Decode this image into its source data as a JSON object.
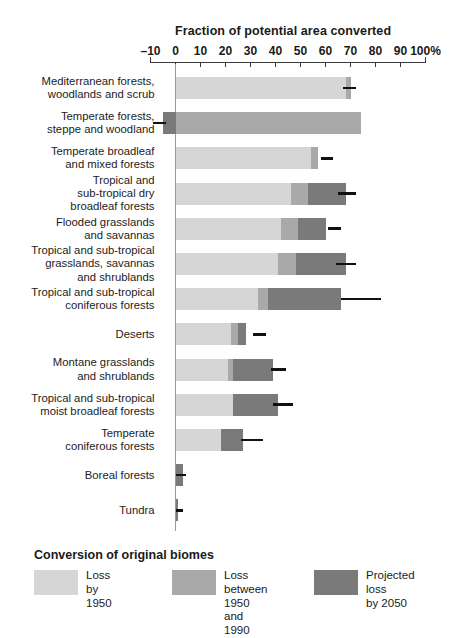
{
  "chart_data": {
    "type": "bar",
    "orientation": "horizontal",
    "stacked": true,
    "title": "Fraction of potential area converted",
    "xlabel": "",
    "ylabel": "",
    "xlim": [
      -10,
      100
    ],
    "xunit": "%",
    "grid": false,
    "legend_position": "bottom",
    "legend_title": "Conversion of original biomes",
    "tick_labels": [
      "–10",
      "0",
      "10",
      "20",
      "30",
      "40",
      "50",
      "60",
      "70",
      "80",
      "90",
      "100%"
    ],
    "tick_values": [
      -10,
      0,
      10,
      20,
      30,
      40,
      50,
      60,
      70,
      80,
      90,
      100
    ],
    "categories": [
      "Mediterranean forests,\nwoodlands and scrub",
      "Temperate forests,\nsteppe and woodland",
      "Temperate broadleaf\nand mixed forests",
      "Tropical and\nsub-tropical dry\nbroadleaf forests",
      "Flooded grasslands\nand savannas",
      "Tropical and sub-tropical\ngrasslands, savannas\nand shrublands",
      "Tropical and sub-tropical\nconiferous forests",
      "Deserts",
      "Montane grasslands\nand shrublands",
      "Tropical and sub-tropical\nmoist broadleaf forests",
      "Temperate\nconiferous forests",
      "Boreal forests",
      "Tundra"
    ],
    "series": [
      {
        "name": "Loss by 1950",
        "color": "#d6d6d6",
        "values": [
          68,
          0,
          54,
          46,
          42,
          41,
          33,
          22,
          21,
          23,
          18,
          0,
          0
        ]
      },
      {
        "name": "Loss between 1950 and 1990",
        "color": "#a9a9a9",
        "values": [
          2,
          74,
          3,
          7,
          7,
          7,
          4,
          3,
          2,
          0,
          0,
          0,
          0
        ]
      },
      {
        "name": "Projected loss by 2050",
        "color": "#7a7a7a",
        "values": [
          0,
          -5,
          0,
          15,
          11,
          20,
          29,
          3,
          16,
          18,
          9,
          3,
          1
        ]
      }
    ],
    "error_bar_ends": [
      72,
      -4,
      63,
      72,
      66,
      72,
      82,
      36,
      44,
      47,
      35,
      4,
      3
    ],
    "error_bar_starts": [
      67,
      -9,
      58,
      65,
      61,
      64,
      66,
      31,
      38,
      39,
      26,
      0,
      0
    ]
  },
  "legend": {
    "title": "Conversion of original biomes",
    "items": [
      {
        "label": "Loss by\n1950",
        "color": "#d6d6d6"
      },
      {
        "label": "Loss between\n1950 and 1990",
        "color": "#a9a9a9"
      },
      {
        "label": "Projected loss\nby 2050",
        "color": "#7a7a7a"
      }
    ]
  }
}
